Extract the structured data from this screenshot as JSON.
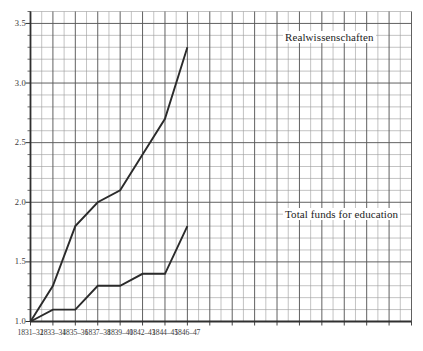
{
  "chart_data": {
    "type": "line",
    "title": "",
    "subtitle": "",
    "xlabel": "",
    "ylabel": "",
    "grid": true,
    "legend_position": "inline-annotation",
    "categories": [
      "1831–32",
      "1833–34",
      "1835–36",
      "1837–38",
      "1839–40",
      "1842–43",
      "1844–45",
      "1846–47"
    ],
    "ylim": [
      1.0,
      3.6
    ],
    "yticks": [
      "1.0",
      "1.5",
      "2.0",
      "2.5",
      "3.0",
      "3.5"
    ],
    "ytick_values": [
      1.0,
      1.5,
      2.0,
      2.5,
      3.0,
      3.5
    ],
    "series": [
      {
        "name": "Realwissenschaften",
        "values": [
          1.0,
          1.3,
          1.8,
          2.0,
          2.1,
          2.4,
          2.7,
          3.3
        ]
      },
      {
        "name": "Total funds for education",
        "values": [
          1.0,
          1.1,
          1.1,
          1.3,
          1.3,
          1.4,
          1.4,
          1.8
        ]
      }
    ],
    "annotations": [
      {
        "text": "Realwissenschaften",
        "series": "Realwissenschaften"
      },
      {
        "text": "Total funds for education",
        "series": "Total funds for education"
      }
    ],
    "colors": {
      "line": "#2b2b2b",
      "grid_major": "#585858",
      "grid_minor": "#9a9a9a",
      "axis": "#303030",
      "text": "#3a3a3a",
      "background": "#ffffff"
    }
  },
  "axes": {
    "y_ticks": [
      {
        "label": "3.5",
        "value": 3.5
      },
      {
        "label": "3.0",
        "value": 3.0
      },
      {
        "label": "2.5",
        "value": 2.5
      },
      {
        "label": "2.0",
        "value": 2.0
      },
      {
        "label": "1.5",
        "value": 1.5
      },
      {
        "label": "1.0",
        "value": 1.0
      }
    ],
    "x_ticks": [
      {
        "label": "1831–32"
      },
      {
        "label": "1833–34"
      },
      {
        "label": "1835–36"
      },
      {
        "label": "1837–38"
      },
      {
        "label": "1839–40"
      },
      {
        "label": "1842–43"
      },
      {
        "label": "1844–45"
      },
      {
        "label": "1846–47"
      }
    ]
  },
  "series_labels": {
    "upper": "Realwissenschaften",
    "lower": "Total funds for education"
  },
  "artifact": {
    "top_text": ""
  }
}
